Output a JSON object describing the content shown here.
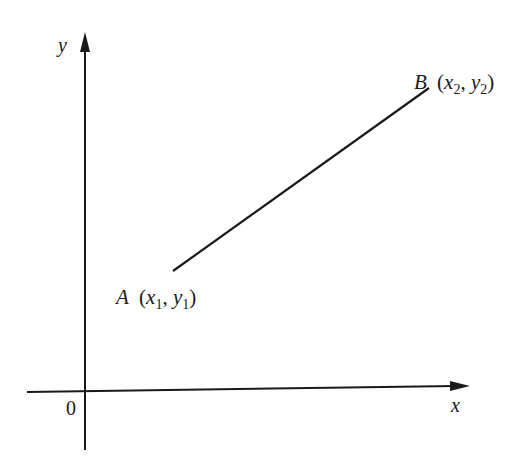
{
  "diagram": {
    "type": "coordinate-plane-line-segment",
    "axes": {
      "x_label": "x",
      "y_label": "y",
      "origin_label": "0"
    },
    "points": [
      {
        "name": "A",
        "x_sub": "1",
        "y_sub": "1",
        "px": 173,
        "py": 271
      },
      {
        "name": "B",
        "x_sub": "2",
        "y_sub": "2",
        "px": 429,
        "py": 88
      }
    ],
    "colors": {
      "stroke": "#1a1a1a",
      "background": "#ffffff"
    }
  }
}
